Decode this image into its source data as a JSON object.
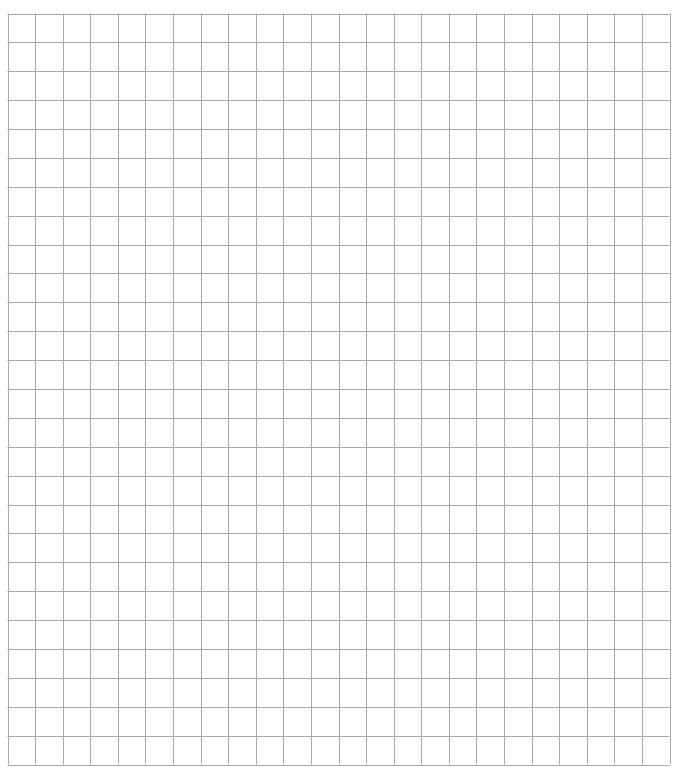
{
  "grid": {
    "columns": 24,
    "rows": 26,
    "left": 7.5,
    "top": 13.5,
    "width": 662,
    "height": 751,
    "line_color": "#a9a9a9",
    "background": "#ffffff"
  }
}
